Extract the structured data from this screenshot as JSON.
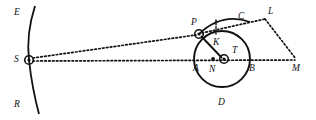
{
  "diagram": {
    "background_color": "#ffffff",
    "stroke_color": "#111111",
    "labels": [
      {
        "name": "label-E",
        "text": "E",
        "x": 14,
        "y": 8
      },
      {
        "name": "label-S",
        "text": "S",
        "x": 14,
        "y": 55
      },
      {
        "name": "label-R",
        "text": "R",
        "x": 14,
        "y": 100
      },
      {
        "name": "label-P",
        "text": "P",
        "x": 191,
        "y": 18
      },
      {
        "name": "label-C",
        "text": "C",
        "x": 238,
        "y": 12
      },
      {
        "name": "label-L",
        "text": "L",
        "x": 268,
        "y": 7
      },
      {
        "name": "label-K",
        "text": "K",
        "x": 213,
        "y": 38
      },
      {
        "name": "label-T",
        "text": "T",
        "x": 232,
        "y": 48
      },
      {
        "name": "label-A",
        "text": "A",
        "x": 193,
        "y": 65
      },
      {
        "name": "label-N",
        "text": "N",
        "x": 209,
        "y": 66
      },
      {
        "name": "label-B",
        "text": "B",
        "x": 248,
        "y": 65
      },
      {
        "name": "label-M",
        "text": "M",
        "x": 293,
        "y": 65
      },
      {
        "name": "label-D",
        "text": "D",
        "x": 218,
        "y": 100
      }
    ],
    "points": [
      {
        "name": "point-S",
        "marker": "concentric-circle",
        "x": 29,
        "y": 60
      },
      {
        "name": "point-P",
        "marker": "concentric-circle",
        "x": 199,
        "y": 34
      },
      {
        "name": "point-T",
        "marker": "concentric-circle",
        "x": 224,
        "y": 59
      },
      {
        "name": "point-N",
        "marker": "solid-dot",
        "x": 213,
        "y": 59
      },
      {
        "name": "point-L",
        "marker": "vertex",
        "x": 265,
        "y": 19
      },
      {
        "name": "point-M",
        "marker": "vertex",
        "x": 296,
        "y": 60
      }
    ],
    "circle": {
      "name": "main-circle",
      "cx": 222,
      "cy": 59,
      "r": 28
    },
    "arc_PC": {
      "name": "arc-p-to-c",
      "description": "arc from P over C"
    },
    "curve_ESR": {
      "name": "curve-e-s-r",
      "description": "slightly curved vertical line E through S to R"
    },
    "segments": [
      {
        "name": "segment-p-t",
        "style": "solid",
        "from": "P",
        "to": "T"
      },
      {
        "name": "segment-s-p",
        "style": "dotted",
        "from": "S",
        "to": "P"
      },
      {
        "name": "segment-s-m",
        "style": "dotted",
        "from": "S",
        "to": "M"
      },
      {
        "name": "segment-p-l",
        "style": "dotted",
        "from": "P",
        "to": "L"
      },
      {
        "name": "segment-l-m",
        "style": "dotted",
        "from": "L",
        "to": "M"
      },
      {
        "name": "segment-k-arc",
        "style": "dotted",
        "from": "arc",
        "to": "K"
      }
    ]
  }
}
